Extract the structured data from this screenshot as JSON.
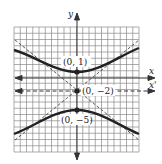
{
  "figure": {
    "type": "hyperbola-graph",
    "axes": {
      "x_label": "x",
      "y_label": "y",
      "translated_x_label": "x'"
    },
    "points": [
      {
        "label": "(0, 1)",
        "x": 0,
        "y": 1
      },
      {
        "label": "(0, −2)",
        "x": 0,
        "y": -2
      },
      {
        "label": "(0, −5)",
        "x": 0,
        "y": -5
      }
    ],
    "grid": {
      "cells": 20,
      "x_range": [
        -10,
        10
      ],
      "y_range": [
        -14,
        6
      ]
    },
    "colors": {
      "grid": "#8a8a8a",
      "curve": "#222222",
      "axis": "#333333",
      "background": "#ffffff"
    }
  }
}
